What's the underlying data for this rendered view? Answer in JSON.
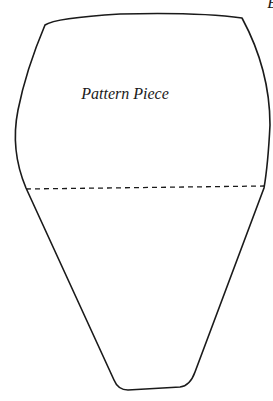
{
  "diagram": {
    "label": "Pattern Piece",
    "corner_letter": "B",
    "outline_color": "#1a1a1a",
    "fold_line_style": "dashed"
  }
}
